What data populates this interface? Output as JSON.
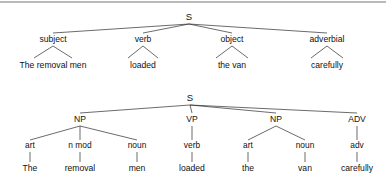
{
  "figure": {
    "sentence": "The removal men loaded the van carefully",
    "rule_color": "#b9b9b9",
    "line_color": "#2b2b2b",
    "text_color": "#111111",
    "background": "#ffffff"
  },
  "tree_functional": {
    "name": "functional-tree",
    "root": "S",
    "nodes": [
      {
        "label": "subject",
        "leaf": "The removal men"
      },
      {
        "label": "verb",
        "leaf": "loaded"
      },
      {
        "label": "object",
        "leaf": "the van"
      },
      {
        "label": "adverbial",
        "leaf": "carefully"
      }
    ]
  },
  "tree_constituent": {
    "name": "constituent-tree",
    "root": "S",
    "branches": [
      {
        "category": "NP",
        "children": [
          {
            "pos": "art",
            "word": "The"
          },
          {
            "pos": "n mod",
            "word": "removal"
          },
          {
            "pos": "noun",
            "word": "men"
          }
        ]
      },
      {
        "category": "VP",
        "children": [
          {
            "pos": "verb",
            "word": "loaded"
          }
        ]
      },
      {
        "category": "NP",
        "children": [
          {
            "pos": "art",
            "word": "the"
          },
          {
            "pos": "noun",
            "word": "van"
          }
        ]
      },
      {
        "category": "ADV",
        "children": [
          {
            "pos": "adv",
            "word": "carefully"
          }
        ]
      }
    ]
  }
}
